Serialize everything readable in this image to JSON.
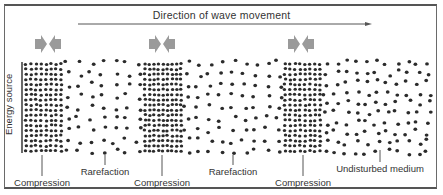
{
  "diagram": {
    "title": "Direction of wave movement",
    "side_label": "Energy source",
    "colors": {
      "dots": "#2b2b2b",
      "arrows": "#9a9a9a",
      "lines": "#555555",
      "background": "#ffffff"
    },
    "arrow_line": {
      "x1": 78,
      "x2": 372,
      "y": 24
    },
    "compression_arrows": [
      {
        "x": 48,
        "y": 44
      },
      {
        "x": 162,
        "y": 44
      },
      {
        "x": 301,
        "y": 44
      }
    ],
    "bands": [
      {
        "type": "compression",
        "x0": 24,
        "x1": 63
      },
      {
        "type": "rarefaction",
        "x0": 63,
        "x1": 143
      },
      {
        "type": "compression",
        "x0": 143,
        "x1": 183
      },
      {
        "type": "rarefaction",
        "x0": 183,
        "x1": 283
      },
      {
        "type": "compression",
        "x0": 283,
        "x1": 322
      },
      {
        "type": "undisturbed",
        "x0": 322,
        "x1": 432
      }
    ],
    "labels": [
      {
        "text": "Compression",
        "x": 42,
        "line_x": 42,
        "line_y0": 155,
        "line_y1": 176,
        "text_y": 177
      },
      {
        "text": "Rarefaction",
        "x": 105,
        "line_x": 105,
        "line_y0": 155,
        "line_y1": 165,
        "text_y": 166
      },
      {
        "text": "Compression",
        "x": 162,
        "line_x": 162,
        "line_y0": 155,
        "line_y1": 176,
        "text_y": 177
      },
      {
        "text": "Rarefaction",
        "x": 233,
        "line_x": 233,
        "line_y0": 155,
        "line_y1": 165,
        "text_y": 166
      },
      {
        "text": "Compression",
        "x": 303,
        "line_x": 303,
        "line_y0": 155,
        "line_y1": 176,
        "text_y": 177
      },
      {
        "text": "Undisturbed medium",
        "x": 380,
        "line_x": 380,
        "line_y0": 150,
        "line_y1": 162,
        "text_y": 163
      }
    ]
  }
}
